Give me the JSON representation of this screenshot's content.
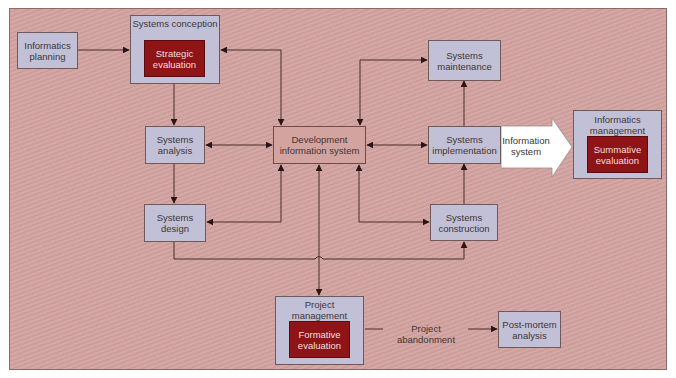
{
  "diagram": {
    "nodes": {
      "informatics_planning": {
        "line1": "Informatics",
        "line2": "planning"
      },
      "systems_conception": {
        "title": "Systems conception",
        "inner_line1": "Strategic",
        "inner_line2": "evaluation"
      },
      "systems_analysis": {
        "line1": "Systems",
        "line2": "analysis"
      },
      "development_information_system": {
        "line1": "Development",
        "line2": "information system"
      },
      "systems_maintenance": {
        "line1": "Systems",
        "line2": "maintenance"
      },
      "systems_implementation": {
        "line1": "Systems",
        "line2": "implementation"
      },
      "information_system_arrow": {
        "line1": "Information",
        "line2": "system"
      },
      "informatics_management": {
        "title_line1": "Informatics",
        "title_line2": "management",
        "inner_line1": "Summative",
        "inner_line2": "evaluation"
      },
      "systems_design": {
        "line1": "Systems",
        "line2": "design"
      },
      "systems_construction": {
        "line1": "Systems",
        "line2": "construction"
      },
      "project_management": {
        "title": "Project management",
        "inner_line1": "Formative",
        "inner_line2": "evaluation"
      },
      "post_mortem_analysis": {
        "line1": "Post-mortem",
        "line2": "analysis"
      }
    },
    "edge_labels": {
      "project_abandonment": "Project abandonment"
    },
    "colors": {
      "background": "#d3a3a0",
      "node_fill": "#c2c0d6",
      "evaluation_fill": "#8e1418",
      "arrow": "#3a2222"
    }
  }
}
